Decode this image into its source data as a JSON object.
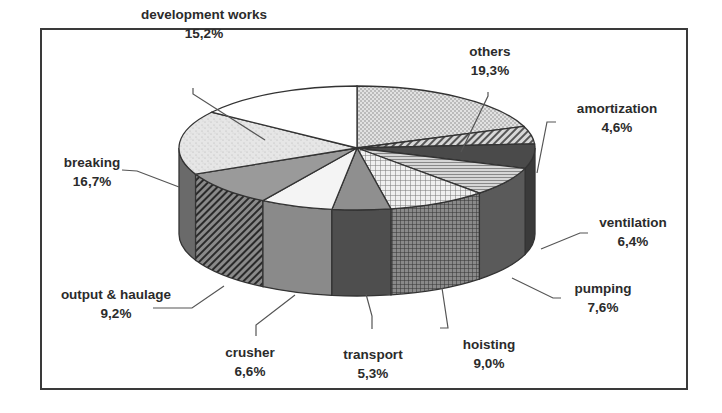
{
  "chart_data": {
    "type": "pie",
    "style": "3d-exploded-none",
    "title": "",
    "categories": [
      "others",
      "amortization",
      "ventilation",
      "pumping",
      "hoisting",
      "transport",
      "crusher",
      "output & haulage",
      "breaking",
      "development works"
    ],
    "values": [
      19.3,
      4.6,
      6.4,
      7.6,
      9.0,
      5.3,
      6.6,
      9.2,
      16.7,
      15.2
    ],
    "value_labels": [
      "19,3%",
      "4,6%",
      "6,4%",
      "7,6%",
      "9,0%",
      "5,3%",
      "6,6%",
      "9,2%",
      "16,7%",
      "15,2%"
    ],
    "unit": "%",
    "start_angle": "12 o'clock, clockwise",
    "legend": "none (callout labels)"
  },
  "labels": [
    {
      "name": "development works",
      "value": "15,2%"
    },
    {
      "name": "others",
      "value": "19,3%"
    },
    {
      "name": "amortization",
      "value": "4,6%"
    },
    {
      "name": "breaking",
      "value": "16,7%"
    },
    {
      "name": "ventilation",
      "value": "6,4%"
    },
    {
      "name": "pumping",
      "value": "7,6%"
    },
    {
      "name": "output & haulage",
      "value": "9,2%"
    },
    {
      "name": "hoisting",
      "value": "9,0%"
    },
    {
      "name": "crusher",
      "value": "6,6%"
    },
    {
      "name": "transport",
      "value": "5,3%"
    }
  ]
}
